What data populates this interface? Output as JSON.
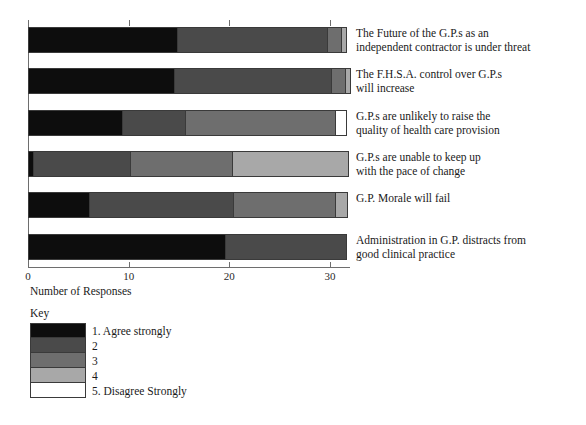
{
  "chart_data": {
    "type": "bar",
    "subtype": "stacked-horizontal",
    "title": "",
    "xlabel": "Number of Responses",
    "ylabel": "",
    "xlim": [
      0,
      32
    ],
    "grid": false,
    "legend_position": "below-left",
    "legend_title": "Key",
    "xticks": [
      0,
      10,
      20,
      30
    ],
    "xticklabels": [
      "0",
      "10",
      "20",
      "30"
    ],
    "categories": [
      "The Future of the G.P.s as an\nindependent contractor is under threat",
      "The F.H.S.A. control over G.P.s\nwill increase",
      "G.P.s are unlikely to raise the\nquality of health care provision",
      "G.P.s are unable to keep up\nwith the pace of change",
      "G.P. Morale will fail",
      "Administration in G.P. distracts from\ngood clinical practice"
    ],
    "series": [
      {
        "name": "1. Agree strongly",
        "color": "#0d0d0d",
        "values": [
          14.8,
          14.5,
          9.3,
          0.5,
          6.1,
          19.6
        ]
      },
      {
        "name": "2",
        "color": "#4a4a4a",
        "values": [
          14.9,
          15.6,
          6.3,
          9.6,
          14.3,
          11.9
        ]
      },
      {
        "name": "3",
        "color": "#6e6e6e",
        "values": [
          1.4,
          1.4,
          14.9,
          10.2,
          10.1,
          0.0
        ]
      },
      {
        "name": "4",
        "color": "#a8a8a8",
        "values": [
          0.4,
          0.4,
          0.0,
          11.4,
          1.1,
          0.0
        ]
      },
      {
        "name": "5. Disagree Strongly",
        "color": "#ffffff",
        "values": [
          0.0,
          0.0,
          1.0,
          0.0,
          0.0,
          0.0
        ]
      }
    ]
  },
  "legend": {
    "title": "Key",
    "items": [
      {
        "label": "1. Agree strongly",
        "color": "#0d0d0d"
      },
      {
        "label": "2",
        "color": "#4a4a4a"
      },
      {
        "label": "3",
        "color": "#6e6e6e"
      },
      {
        "label": "4",
        "color": "#a8a8a8"
      },
      {
        "label": "5. Disagree Strongly",
        "color": "#ffffff"
      }
    ]
  },
  "axis": {
    "xlabel": "Number of Responses",
    "tick_labels": [
      "0",
      "10",
      "20",
      "30"
    ]
  }
}
